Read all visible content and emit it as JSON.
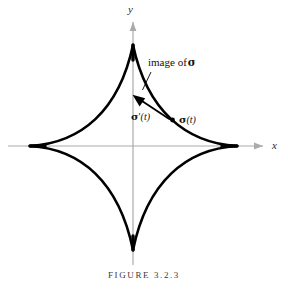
{
  "figure": {
    "caption": "FIGURE 3.2.3",
    "axes": {
      "x_label": "x",
      "y_label": "y",
      "axis_color": "#aaaaaa",
      "origin": {
        "x": 133,
        "y": 146
      }
    },
    "curve": {
      "name": "astroid",
      "color": "#000000",
      "stroke_width": 2.6,
      "cusps": [
        {
          "name": "right-cusp",
          "x": 237,
          "y": 146
        },
        {
          "name": "top-cusp",
          "x": 133,
          "y": 45
        },
        {
          "name": "left-cusp",
          "x": 30,
          "y": 146
        },
        {
          "name": "bottom-cusp",
          "x": 133,
          "y": 250
        }
      ]
    },
    "annotations": {
      "image_of_sigma": {
        "text_prefix": "image of",
        "symbol": "σ",
        "leader_from": {
          "x": 151,
          "y": 72
        },
        "leader_to": {
          "x": 142,
          "y": 91
        }
      },
      "sigma_prime_t": {
        "symbol": "σ",
        "prime": "′",
        "argument": "(t)",
        "vector_tail": {
          "x": 170,
          "y": 119
        },
        "vector_tip": {
          "x": 133,
          "y": 95
        }
      },
      "sigma_t": {
        "symbol": "σ",
        "argument": "(t)",
        "point": {
          "x": 172,
          "y": 120
        }
      }
    }
  }
}
